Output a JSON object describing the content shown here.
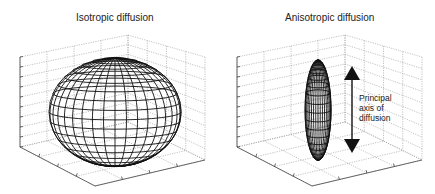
{
  "figure": {
    "panels": [
      {
        "id": "isotropic",
        "title": "Isotropic diffusion",
        "shape": "sphere",
        "wireframe": {
          "meridians": 18,
          "parallels": 18
        }
      },
      {
        "id": "anisotropic",
        "title": "Anisotropic diffusion",
        "shape": "prolate-ellipsoid",
        "wireframe": {
          "meridians": 18,
          "parallels": 18
        },
        "annotation": {
          "lines": [
            "Principal",
            "axis of",
            "diffusion"
          ],
          "arrow": "double-headed-vertical"
        }
      }
    ],
    "colors": {
      "wire": "#111111",
      "grid": "#9a9a9a",
      "background": "#ffffff",
      "arrow": "#111111"
    }
  }
}
